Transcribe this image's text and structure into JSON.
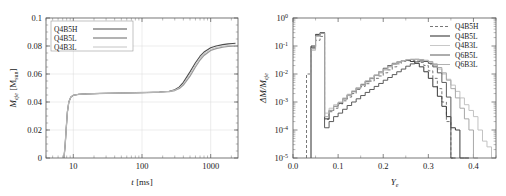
{
  "figure": {
    "title": "",
    "panels": [
      "left-mass-evolution",
      "right-ye-histogram"
    ]
  },
  "left_panel": {
    "xlabel": "t [ms]",
    "ylabel": "M_eje [M_sun]",
    "ylabel_main": "M",
    "ylabel_sub": "eje",
    "ylabel_unit_open": " [M",
    "ylabel_unit_sub": "sun",
    "ylabel_unit_close": "]",
    "xlabel_main": "t",
    "xlabel_unit": " [ms]",
    "xticks": [
      "10",
      "100",
      "1000"
    ],
    "yticks": [
      "0",
      "0.02",
      "0.04",
      "0.06",
      "0.08",
      "0.1"
    ],
    "legend": [
      {
        "label": "Q4B5H",
        "color": "#4d4d4d",
        "dash": "none",
        "width": 1.1
      },
      {
        "label": "Q4B5L",
        "color": "#9a9a9a",
        "dash": "none",
        "width": 1.3
      },
      {
        "label": "Q4B3L",
        "color": "#bdbdbd",
        "dash": "none",
        "width": 0.9
      }
    ]
  },
  "right_panel": {
    "xlabel": "Y_e",
    "ylabel": "ΔM/M_eje",
    "ylabel_delta": "ΔM/M",
    "ylabel_sub": "eje",
    "xlabel_main": "Y",
    "xlabel_sub": "e",
    "xticks": [
      "0.0",
      "0.1",
      "0.2",
      "0.3",
      "0.4"
    ],
    "yticks": [
      "10⁻⁵",
      "10⁻⁴",
      "10⁻³",
      "10⁻²",
      "10⁻¹",
      "10⁰"
    ],
    "ytick_exponents": [
      "-5",
      "-4",
      "-3",
      "-2",
      "-1",
      "0"
    ],
    "legend": [
      {
        "label": "Q4B5H",
        "color": "#777777",
        "dash": "3,2",
        "width": 1.0
      },
      {
        "label": "Q4B5L",
        "color": "#3a3a3a",
        "dash": "none",
        "width": 1.1
      },
      {
        "label": "Q4B3L",
        "color": "#c2c2c2",
        "dash": "none",
        "width": 0.9
      },
      {
        "label": "Q6B5L",
        "color": "#5a5a5a",
        "dash": "none",
        "width": 1.0
      },
      {
        "label": "Q6B3L",
        "color": "#a8a8a8",
        "dash": "none",
        "width": 0.9
      }
    ]
  },
  "chart_data": [
    {
      "type": "line",
      "id": "ejecta-mass-vs-time",
      "title": "",
      "xlabel": "t [ms]",
      "ylabel": "M_eje [M_sun]",
      "xscale": "log",
      "yscale": "linear",
      "xlim": [
        4,
        2500
      ],
      "ylim": [
        0,
        0.1
      ],
      "grid": true,
      "legend_position": "upper-left",
      "series": [
        {
          "name": "Q4B5H",
          "color": "#4d4d4d",
          "x": [
            7.3,
            7.6,
            7.9,
            8.2,
            8.6,
            9.2,
            10,
            12,
            15,
            20,
            30,
            50,
            80,
            120,
            180,
            250,
            300,
            350,
            400,
            500,
            600,
            700,
            800,
            1000,
            1200,
            1500,
            1800,
            2100,
            2300
          ],
          "y": [
            0.0,
            0.009,
            0.022,
            0.033,
            0.04,
            0.0435,
            0.0448,
            0.0455,
            0.0458,
            0.046,
            0.0462,
            0.0464,
            0.0466,
            0.0468,
            0.0471,
            0.0477,
            0.0487,
            0.0508,
            0.054,
            0.0615,
            0.068,
            0.0727,
            0.0757,
            0.0788,
            0.08,
            0.081,
            0.0815,
            0.0818,
            0.082
          ]
        },
        {
          "name": "Q4B5L",
          "color": "#9a9a9a",
          "x": [
            7.3,
            7.6,
            7.9,
            8.2,
            8.6,
            9.2,
            10,
            12,
            15,
            20,
            30,
            50,
            80,
            120,
            180,
            250,
            300,
            350,
            400,
            500,
            600,
            700,
            800,
            1000,
            1200,
            1500,
            1800,
            2100,
            2300
          ],
          "y": [
            0.0,
            0.009,
            0.022,
            0.033,
            0.04,
            0.0435,
            0.0448,
            0.0455,
            0.0458,
            0.046,
            0.0462,
            0.0464,
            0.0466,
            0.0468,
            0.047,
            0.0475,
            0.0482,
            0.0497,
            0.0521,
            0.0585,
            0.065,
            0.07,
            0.0733,
            0.0768,
            0.0782,
            0.0792,
            0.0797,
            0.0799,
            0.08
          ]
        },
        {
          "name": "Q4B3L",
          "color": "#bdbdbd",
          "x": [
            7.3,
            7.6,
            7.9,
            8.2,
            8.6,
            9.2,
            10,
            12,
            15,
            20,
            30,
            50,
            80,
            120,
            180,
            250,
            300,
            350,
            400,
            500,
            600,
            700,
            800,
            1000,
            1200,
            1500,
            1800,
            2100,
            2300
          ],
          "y": [
            0.0,
            0.009,
            0.022,
            0.033,
            0.04,
            0.0435,
            0.0448,
            0.0455,
            0.0458,
            0.046,
            0.0462,
            0.0464,
            0.0466,
            0.0468,
            0.047,
            0.0476,
            0.0484,
            0.0502,
            0.053,
            0.06,
            0.0665,
            0.0713,
            0.0745,
            0.0776,
            0.0789,
            0.0798,
            0.0803,
            0.0805,
            0.0806
          ]
        }
      ]
    },
    {
      "type": "line",
      "id": "electron-fraction-histogram",
      "title": "",
      "xlabel": "Y_e",
      "ylabel": "ΔM/M_eje",
      "xscale": "linear",
      "yscale": "log",
      "xlim": [
        0.0,
        0.45
      ],
      "ylim": [
        1e-05,
        1.0
      ],
      "grid": false,
      "histogram": true,
      "bin_width": 0.01,
      "legend_position": "upper-right",
      "series": [
        {
          "name": "Q4B5H",
          "color": "#777777",
          "dash": "3,2",
          "bin_left": [
            0.03,
            0.04,
            0.05,
            0.06,
            0.07,
            0.08,
            0.09,
            0.1,
            0.11,
            0.12,
            0.13,
            0.14,
            0.15,
            0.16,
            0.17,
            0.18,
            0.19,
            0.2,
            0.21,
            0.22,
            0.23,
            0.24,
            0.25,
            0.26,
            0.27,
            0.28,
            0.29,
            0.3,
            0.31,
            0.32,
            0.33,
            0.34,
            0.35
          ],
          "values": [
            0.01,
            0.08,
            0.16,
            0.22,
            0.00024,
            0.00045,
            0.0006,
            0.00085,
            0.0011,
            0.0015,
            0.002,
            0.0028,
            0.0036,
            0.0045,
            0.0056,
            0.007,
            0.0085,
            0.011,
            0.014,
            0.018,
            0.023,
            0.028,
            0.03,
            0.031,
            0.029,
            0.026,
            0.02,
            0.013,
            0.007,
            0.003,
            0.001,
            0.0002,
            1e-05
          ]
        },
        {
          "name": "Q4B5L",
          "color": "#3a3a3a",
          "dash": "none",
          "bin_left": [
            0.04,
            0.05,
            0.06,
            0.07,
            0.08,
            0.09,
            0.1,
            0.11,
            0.12,
            0.13,
            0.14,
            0.15,
            0.16,
            0.17,
            0.18,
            0.19,
            0.2,
            0.21,
            0.22,
            0.23,
            0.24,
            0.25,
            0.26,
            0.27,
            0.28,
            0.29,
            0.3,
            0.31,
            0.32,
            0.33,
            0.34,
            0.35,
            0.36,
            0.37,
            0.38
          ],
          "values": [
            0.1,
            0.26,
            0.3,
            0.00025,
            0.0005,
            0.0007,
            0.0009,
            0.0013,
            0.0018,
            0.0024,
            0.0032,
            0.0042,
            0.0055,
            0.007,
            0.009,
            0.012,
            0.016,
            0.02,
            0.024,
            0.027,
            0.03,
            0.031,
            0.028,
            0.024,
            0.018,
            0.012,
            0.007,
            0.0035,
            0.0016,
            0.0007,
            0.0003,
            0.00012,
            0.0001,
            1e-05,
            1e-05
          ]
        },
        {
          "name": "Q4B3L",
          "color": "#c2c2c2",
          "dash": "none",
          "bin_left": [
            0.04,
            0.05,
            0.06,
            0.07,
            0.08,
            0.09,
            0.1,
            0.11,
            0.12,
            0.13,
            0.14,
            0.15,
            0.16,
            0.17,
            0.18,
            0.19,
            0.2,
            0.21,
            0.22,
            0.23,
            0.24,
            0.25,
            0.26,
            0.27,
            0.28,
            0.29,
            0.3,
            0.31,
            0.32,
            0.33,
            0.34,
            0.35,
            0.36,
            0.37,
            0.38,
            0.39,
            0.4,
            0.41,
            0.42,
            0.43
          ],
          "values": [
            0.07,
            0.22,
            0.28,
            0.0004,
            0.0006,
            0.0008,
            0.001,
            0.0014,
            0.0019,
            0.0025,
            0.0033,
            0.0044,
            0.0058,
            0.0075,
            0.0095,
            0.012,
            0.015,
            0.019,
            0.023,
            0.027,
            0.03,
            0.033,
            0.034,
            0.033,
            0.031,
            0.028,
            0.025,
            0.02,
            0.015,
            0.01,
            0.0065,
            0.004,
            0.0024,
            0.0014,
            0.0008,
            0.0005,
            0.0003,
            0.0001,
            4e-05,
            2.5e-05
          ]
        },
        {
          "name": "Q6B5L",
          "color": "#5a5a5a",
          "dash": "none",
          "bin_left": [
            0.04,
            0.05,
            0.06,
            0.07,
            0.08,
            0.09,
            0.1,
            0.11,
            0.12,
            0.13,
            0.14,
            0.15,
            0.16,
            0.17,
            0.18,
            0.19,
            0.2,
            0.21,
            0.22,
            0.23,
            0.24,
            0.25,
            0.26,
            0.27,
            0.28,
            0.29,
            0.3,
            0.31,
            0.32,
            0.33,
            0.34,
            0.35
          ],
          "values": [
            0.09,
            0.24,
            0.29,
            0.00012,
            0.0002,
            0.0003,
            0.0004,
            0.00055,
            0.00075,
            0.001,
            0.0013,
            0.0017,
            0.0022,
            0.0028,
            0.0036,
            0.0046,
            0.006,
            0.0075,
            0.0095,
            0.012,
            0.015,
            0.019,
            0.023,
            0.027,
            0.029,
            0.028,
            0.024,
            0.018,
            0.011,
            0.005,
            0.0015,
            1e-05
          ]
        },
        {
          "name": "Q6B3L",
          "color": "#a8a8a8",
          "dash": "none",
          "bin_left": [
            0.04,
            0.05,
            0.06,
            0.07,
            0.08,
            0.09,
            0.1,
            0.11,
            0.12,
            0.13,
            0.14,
            0.15,
            0.16,
            0.17,
            0.18,
            0.19,
            0.2,
            0.21,
            0.22,
            0.23,
            0.24,
            0.25,
            0.26,
            0.27,
            0.28,
            0.29,
            0.3,
            0.31,
            0.32,
            0.33,
            0.34,
            0.35,
            0.36,
            0.37,
            0.38,
            0.39,
            0.4
          ],
          "values": [
            0.08,
            0.23,
            0.285,
            0.0003,
            0.0005,
            0.0007,
            0.00095,
            0.0013,
            0.0017,
            0.0023,
            0.003,
            0.004,
            0.0052,
            0.0068,
            0.0088,
            0.011,
            0.014,
            0.018,
            0.022,
            0.026,
            0.029,
            0.032,
            0.033,
            0.034,
            0.033,
            0.031,
            0.028,
            0.023,
            0.017,
            0.011,
            0.006,
            0.003,
            0.0014,
            0.0006,
            0.00025,
            0.0001,
            1e-05
          ]
        }
      ]
    }
  ]
}
